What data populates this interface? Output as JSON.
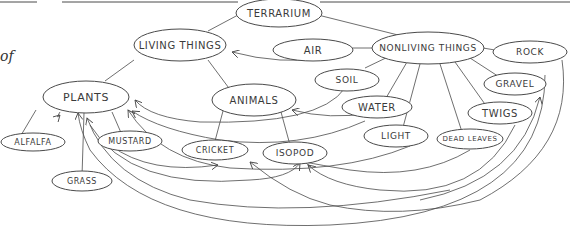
{
  "fragment_text": "of",
  "nodes": {
    "terrarium": "TERRARIUM",
    "living_things": "LIVING THINGS",
    "nonliving_things": "NONLIVING THINGS",
    "air": "AIR",
    "rock": "ROCK",
    "soil": "SOIL",
    "gravel": "GRAVEL",
    "plants": "PLANTS",
    "animals": "ANIMALS",
    "water": "WATER",
    "twigs": "TWIGS",
    "alfalfa": "ALFALFA",
    "mustard": "MUSTARD",
    "cricket": "CRICKET",
    "isopod": "ISOPOD",
    "light": "LIGHT",
    "dead_leaves": "DEAD LEAVES",
    "grass": "GRASS"
  },
  "colors": {
    "line": "#4a4a4a",
    "text": "#3a3a3a",
    "background": "#ffffff"
  }
}
